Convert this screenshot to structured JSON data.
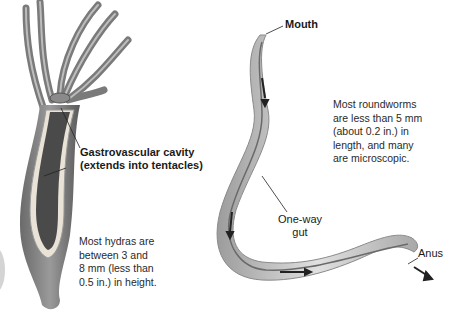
{
  "hydra": {
    "label_line1": "Gastrovascular cavity",
    "label_line2": "(extends into tentacles)",
    "note": [
      "Most hydras are",
      "between 3 and",
      "8 mm (less than",
      "0.5 in.) in height."
    ]
  },
  "roundworm": {
    "mouth_label": "Mouth",
    "gut_label_line1": "One-way",
    "gut_label_line2": "gut",
    "anus_label": "Anus",
    "note": [
      "Most roundworms",
      "are less than 5 mm",
      "(about 0.2 in.) in",
      "length, and many",
      "are microscopic."
    ]
  }
}
